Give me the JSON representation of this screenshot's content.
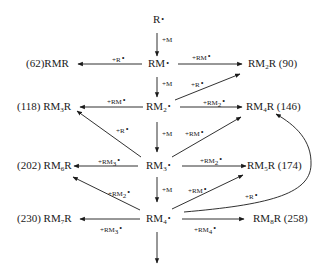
{
  "diagram": {
    "type": "radical polymerization reaction scheme",
    "radical_symbol": "•",
    "nodes": {
      "R": {
        "label": "R",
        "radical": true
      },
      "RM": {
        "label": "RM",
        "radical": true
      },
      "RM2": {
        "label": "RM",
        "sub": "2",
        "radical": true
      },
      "RM3": {
        "label": "RM",
        "sub": "3",
        "radical": true
      },
      "RM4": {
        "label": "RM",
        "sub": "4",
        "radical": true
      },
      "RMR": {
        "prefix": "(62)",
        "label": "RMR"
      },
      "RM2R": {
        "label": "RM",
        "sub": "2",
        "suffix": "R (90)"
      },
      "RM3R": {
        "prefix": "(118)",
        "label": "RM",
        "sub": "3",
        "suffix": "R"
      },
      "RM4R": {
        "label": "RM",
        "sub": "4",
        "suffix": "R (146)"
      },
      "RM5R": {
        "label": "RM",
        "sub": "5",
        "suffix": "R (174)"
      },
      "RM6R": {
        "prefix": "(202)",
        "label": "RM",
        "sub": "6",
        "suffix": "R"
      },
      "RM7R": {
        "prefix": "(230)",
        "label": "RM",
        "sub": "7",
        "suffix": "R"
      },
      "RM8R": {
        "label": "RM",
        "sub": "8",
        "suffix": "R (258)"
      }
    },
    "edges": [
      {
        "from": "R",
        "to": "RM",
        "label": "+M"
      },
      {
        "from": "RM",
        "to": "RMR",
        "label": "+R",
        "radical": true
      },
      {
        "from": "RM",
        "to": "RM2R",
        "label": "+RM",
        "radical": true
      },
      {
        "from": "RM",
        "to": "RM2",
        "label": "+M"
      },
      {
        "from": "RM2",
        "to": "RM2R",
        "label": "+R",
        "radical": true
      },
      {
        "from": "RM2",
        "to": "RM3R",
        "label": "+RM",
        "radical": true
      },
      {
        "from": "RM2",
        "to": "RM4R",
        "label": "+RM",
        "sub": "2",
        "radical": true
      },
      {
        "from": "RM2",
        "to": "RM3",
        "label": "+M"
      },
      {
        "from": "RM3",
        "to": "RM3R",
        "label": "+R",
        "radical": true
      },
      {
        "from": "RM3",
        "to": "RM4R",
        "label": "+RM",
        "radical": true
      },
      {
        "from": "RM3",
        "to": "RM6R",
        "label": "+RM",
        "sub": "3",
        "radical": true
      },
      {
        "from": "RM3",
        "to": "RM5R",
        "label": "+RM",
        "sub": "2",
        "radical": true
      },
      {
        "from": "RM3",
        "to": "RM4",
        "label": "+M"
      },
      {
        "from": "RM4",
        "to": "RM6R",
        "label": "+RM",
        "sub": "2",
        "radical": true
      },
      {
        "from": "RM4",
        "to": "RM5R",
        "label": "+RM",
        "radical": true
      },
      {
        "from": "RM4",
        "to": "RM4R",
        "label": "+R",
        "radical": true,
        "curved": true
      },
      {
        "from": "RM4",
        "to": "RM7R",
        "label": "+RM",
        "sub": "3",
        "radical": true
      },
      {
        "from": "RM4",
        "to": "RM8R",
        "label": "+RM",
        "sub": "4",
        "radical": true
      },
      {
        "from": "RM4",
        "to": "continuation",
        "label": ""
      }
    ]
  },
  "labels": {
    "R": "R",
    "RM": "RM",
    "RM_base": "RM",
    "dot": "•",
    "s2": "2",
    "s3": "3",
    "s4": "4",
    "s5": "5",
    "s6": "6",
    "s7": "7",
    "s8": "8",
    "p62": "(62)",
    "p118": "(118)",
    "p202": "(202)",
    "p230": "(230)",
    "RMR": "RMR",
    "Rsuf": "R",
    "suf90": "R (90)",
    "suf146": "R (146)",
    "suf174": "R (174)",
    "suf258": "R (258)",
    "plusM": "+M",
    "plusR": "+R",
    "plusRM": "+RM"
  }
}
